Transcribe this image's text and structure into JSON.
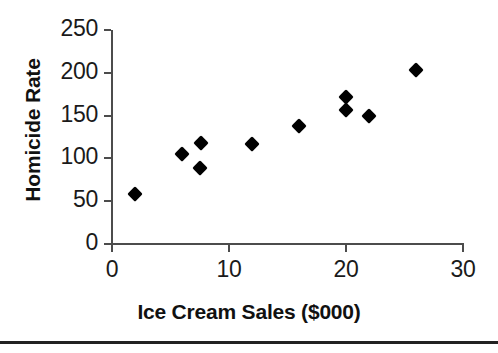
{
  "chart_data": {
    "type": "scatter",
    "title": "",
    "xlabel": "Ice Cream Sales ($000)",
    "ylabel": "Homicide Rate",
    "xlim": [
      0,
      30
    ],
    "ylim": [
      0,
      250
    ],
    "xticks": [
      "0",
      "10",
      "20",
      "30"
    ],
    "xtick_values": [
      0,
      10,
      20,
      30
    ],
    "yticks": [
      "0",
      "50",
      "100",
      "150",
      "200",
      "250"
    ],
    "ytick_values": [
      0,
      50,
      100,
      150,
      200,
      250
    ],
    "grid": false,
    "legend": null,
    "marker": {
      "shape": "diamond",
      "color": "#000000",
      "size": 11
    },
    "axis_color": "#4c4c4c",
    "background": "#ffffff",
    "points": [
      {
        "x": 2,
        "y": 58
      },
      {
        "x": 6,
        "y": 105
      },
      {
        "x": 7.6,
        "y": 118
      },
      {
        "x": 7.5,
        "y": 89
      },
      {
        "x": 12,
        "y": 117
      },
      {
        "x": 16,
        "y": 138
      },
      {
        "x": 20,
        "y": 172
      },
      {
        "x": 20,
        "y": 157
      },
      {
        "x": 22,
        "y": 150
      },
      {
        "x": 26,
        "y": 203
      }
    ]
  }
}
